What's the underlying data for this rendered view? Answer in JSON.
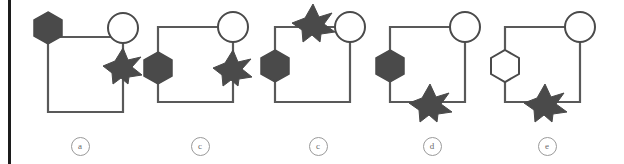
{
  "figure": {
    "type": "graph-diagram-series",
    "width": 624,
    "height": 164,
    "background_color": "#ffffff",
    "page_border": {
      "name": "page-border-left",
      "color": "#1c1c1c",
      "visible": true
    },
    "style": {
      "edge_color": "#595959",
      "edge_width": 2.2,
      "node_fill_dark": "#4a4a4a",
      "node_fill_light": "#ffffff",
      "node_stroke": "#4a4a4a",
      "caption_color": "#6d6d6d"
    },
    "panels": [
      {
        "id": "panel-a",
        "caption": "a",
        "x": 20,
        "square": {
          "left": 28,
          "top": 37,
          "size": 75
        },
        "nodes": [
          {
            "name": "hexagon-node",
            "shape": "hexagon",
            "fill": "dark",
            "cx": 28,
            "cy": 28,
            "r": 16
          },
          {
            "name": "circle-node",
            "shape": "circle",
            "fill": "light",
            "cx": 103,
            "cy": 28,
            "r": 15
          },
          {
            "name": "star-node",
            "shape": "star",
            "fill": "dark",
            "cx": 103,
            "cy": 66,
            "r": 18
          }
        ]
      },
      {
        "id": "panel-b",
        "caption": "c",
        "x": 140,
        "square": {
          "left": 18,
          "top": 27,
          "size": 75
        },
        "nodes": [
          {
            "name": "circle-node",
            "shape": "circle",
            "fill": "light",
            "cx": 93,
            "cy": 27,
            "r": 15
          },
          {
            "name": "hexagon-node",
            "shape": "hexagon",
            "fill": "dark",
            "cx": 18,
            "cy": 68,
            "r": 16
          },
          {
            "name": "star-node",
            "shape": "star",
            "fill": "dark",
            "cx": 93,
            "cy": 68,
            "r": 18
          }
        ]
      },
      {
        "id": "panel-c",
        "caption": "c",
        "x": 258,
        "square": {
          "left": 17,
          "top": 27,
          "size": 75
        },
        "nodes": [
          {
            "name": "star-node",
            "shape": "star",
            "fill": "dark",
            "cx": 55,
            "cy": 24,
            "r": 19
          },
          {
            "name": "circle-node",
            "shape": "circle",
            "fill": "light",
            "cx": 92,
            "cy": 27,
            "r": 15
          },
          {
            "name": "hexagon-node",
            "shape": "hexagon",
            "fill": "dark",
            "cx": 17,
            "cy": 66,
            "r": 16
          }
        ]
      },
      {
        "id": "panel-d",
        "caption": "d",
        "x": 372,
        "square": {
          "left": 18,
          "top": 27,
          "size": 75
        },
        "nodes": [
          {
            "name": "circle-node",
            "shape": "circle",
            "fill": "light",
            "cx": 93,
            "cy": 27,
            "r": 15
          },
          {
            "name": "hexagon-node",
            "shape": "hexagon",
            "fill": "dark",
            "cx": 18,
            "cy": 66,
            "r": 16
          },
          {
            "name": "star-node",
            "shape": "star",
            "fill": "dark",
            "cx": 58,
            "cy": 102,
            "r": 18
          }
        ]
      },
      {
        "id": "panel-e",
        "caption": "e",
        "x": 487,
        "square": {
          "left": 18,
          "top": 27,
          "size": 75
        },
        "nodes": [
          {
            "name": "circle-node",
            "shape": "circle",
            "fill": "light",
            "cx": 93,
            "cy": 27,
            "r": 15
          },
          {
            "name": "hexagon-node",
            "shape": "hexagon",
            "fill": "light",
            "cx": 18,
            "cy": 66,
            "r": 16
          },
          {
            "name": "star-node",
            "shape": "star",
            "fill": "dark",
            "cx": 58,
            "cy": 102,
            "r": 18
          }
        ]
      }
    ]
  }
}
